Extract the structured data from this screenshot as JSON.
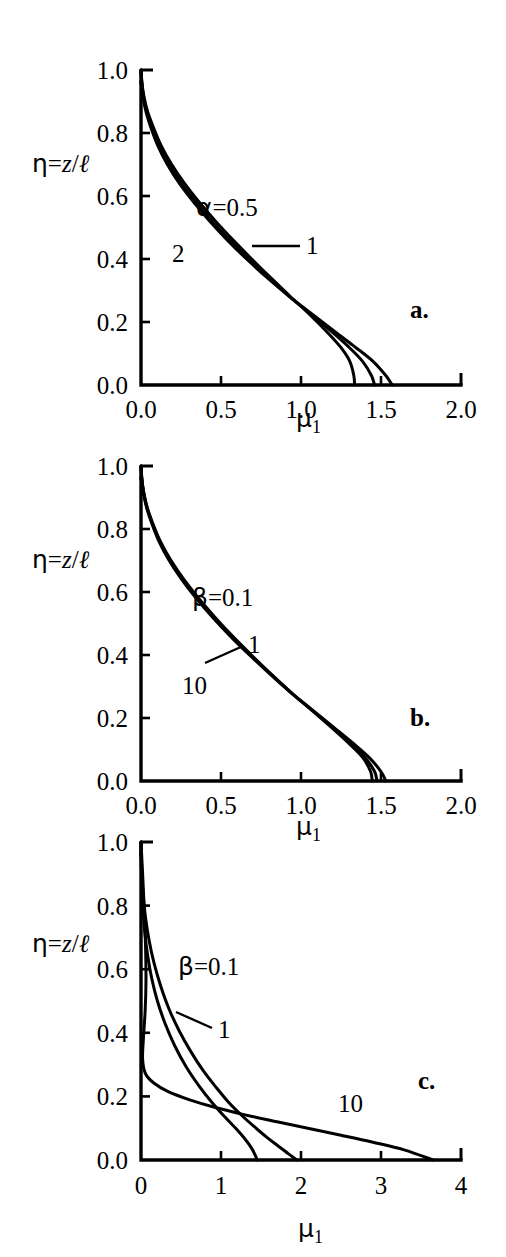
{
  "figure": {
    "background": "#ffffff",
    "line_color": "#000000",
    "axis_color": "#000000"
  },
  "panels": [
    {
      "id": "a",
      "letter": "a.",
      "y_axis_title": "η=z/ℓ",
      "x_axis_title": "μ₁",
      "x_ticks": [
        "0.0",
        "0.5",
        "1.0",
        "1.5",
        "2.0"
      ],
      "y_ticks": [
        "0.0",
        "0.2",
        "0.4",
        "0.6",
        "0.8",
        "1.0"
      ],
      "curve_labels": [
        {
          "text": "α=0.5",
          "name": "alpha-0p5"
        },
        {
          "text": "1",
          "name": "alpha-1"
        },
        {
          "text": "2",
          "name": "alpha-2"
        }
      ]
    },
    {
      "id": "b",
      "letter": "b.",
      "y_axis_title": "η=z/ℓ",
      "x_axis_title": "μ₁",
      "x_ticks": [
        "0.0",
        "0.5",
        "1.0",
        "1.5",
        "2.0"
      ],
      "y_ticks": [
        "0.0",
        "0.2",
        "0.4",
        "0.6",
        "0.8",
        "1.0"
      ],
      "curve_labels": [
        {
          "text": "β=0.1",
          "name": "beta-0p1"
        },
        {
          "text": "1",
          "name": "beta-1"
        },
        {
          "text": "10",
          "name": "beta-10"
        }
      ]
    },
    {
      "id": "c",
      "letter": "c.",
      "y_axis_title": "η=z/ℓ",
      "x_axis_title": "μ₁",
      "x_ticks": [
        "0",
        "1",
        "2",
        "3",
        "4"
      ],
      "y_ticks": [
        "0.0",
        "0.2",
        "0.4",
        "0.6",
        "0.8",
        "1.0"
      ],
      "curve_labels": [
        {
          "text": "β=0.1",
          "name": "beta-0p1"
        },
        {
          "text": "1",
          "name": "beta-1"
        },
        {
          "text": "10",
          "name": "beta-10"
        }
      ]
    }
  ],
  "chart_data": [
    {
      "type": "line",
      "panel": "a",
      "title": "",
      "xlabel": "μ₁",
      "ylabel": "η=z/ℓ",
      "xlim": [
        0.0,
        2.0
      ],
      "ylim": [
        0.0,
        1.0
      ],
      "xticks": [
        0.0,
        0.5,
        1.0,
        1.5,
        2.0
      ],
      "yticks": [
        0.0,
        0.2,
        0.4,
        0.6,
        0.8,
        1.0
      ],
      "grid": false,
      "legend": "inline-labels",
      "annotations": [
        "α=0.5",
        "1",
        "2",
        "a."
      ],
      "series": [
        {
          "name": "α=0.5",
          "x": [
            0.0,
            0.004,
            0.012,
            0.03,
            0.06,
            0.105,
            0.165,
            0.24,
            0.33,
            0.43,
            0.54,
            0.66,
            0.79,
            0.93,
            1.07,
            1.21,
            1.34,
            1.45,
            1.53,
            1.57
          ],
          "y": [
            1.0,
            0.96,
            0.92,
            0.87,
            0.82,
            0.76,
            0.7,
            0.64,
            0.58,
            0.52,
            0.46,
            0.4,
            0.34,
            0.28,
            0.225,
            0.17,
            0.12,
            0.075,
            0.03,
            0.0
          ]
        },
        {
          "name": "1",
          "x": [
            0.0,
            0.005,
            0.014,
            0.034,
            0.066,
            0.113,
            0.175,
            0.252,
            0.342,
            0.443,
            0.553,
            0.672,
            0.798,
            0.93,
            1.062,
            1.19,
            1.3,
            1.385,
            1.44,
            1.46
          ],
          "y": [
            1.0,
            0.96,
            0.92,
            0.87,
            0.82,
            0.76,
            0.7,
            0.64,
            0.58,
            0.52,
            0.46,
            0.4,
            0.34,
            0.28,
            0.225,
            0.17,
            0.12,
            0.075,
            0.03,
            0.0
          ]
        },
        {
          "name": "2",
          "x": [
            0.0,
            0.006,
            0.017,
            0.04,
            0.076,
            0.126,
            0.192,
            0.272,
            0.364,
            0.466,
            0.576,
            0.692,
            0.812,
            0.935,
            1.052,
            1.16,
            1.248,
            1.305,
            1.33,
            1.335
          ],
          "y": [
            1.0,
            0.96,
            0.92,
            0.87,
            0.82,
            0.76,
            0.7,
            0.64,
            0.58,
            0.52,
            0.46,
            0.4,
            0.34,
            0.28,
            0.225,
            0.17,
            0.12,
            0.075,
            0.03,
            0.0
          ]
        }
      ]
    },
    {
      "type": "line",
      "panel": "b",
      "title": "",
      "xlabel": "μ₁",
      "ylabel": "η=z/ℓ",
      "xlim": [
        0.0,
        2.0
      ],
      "ylim": [
        0.0,
        1.0
      ],
      "xticks": [
        0.0,
        0.5,
        1.0,
        1.5,
        2.0
      ],
      "yticks": [
        0.0,
        0.2,
        0.4,
        0.6,
        0.8,
        1.0
      ],
      "grid": false,
      "legend": "inline-labels",
      "annotations": [
        "β=0.1",
        "1",
        "10",
        "b."
      ],
      "series": [
        {
          "name": "β=0.1",
          "x": [
            0.0,
            0.005,
            0.014,
            0.034,
            0.066,
            0.113,
            0.176,
            0.254,
            0.345,
            0.447,
            0.558,
            0.678,
            0.805,
            0.938,
            1.072,
            1.205,
            1.325,
            1.425,
            1.5,
            1.53
          ],
          "y": [
            1.0,
            0.96,
            0.92,
            0.87,
            0.82,
            0.76,
            0.7,
            0.64,
            0.58,
            0.52,
            0.46,
            0.4,
            0.34,
            0.28,
            0.225,
            0.17,
            0.12,
            0.075,
            0.03,
            0.0
          ]
        },
        {
          "name": "1",
          "x": [
            0.0,
            0.005,
            0.015,
            0.036,
            0.069,
            0.118,
            0.182,
            0.261,
            0.353,
            0.455,
            0.566,
            0.685,
            0.81,
            0.94,
            1.07,
            1.198,
            1.31,
            1.4,
            1.46,
            1.475
          ],
          "y": [
            1.0,
            0.96,
            0.92,
            0.87,
            0.82,
            0.76,
            0.7,
            0.64,
            0.58,
            0.52,
            0.46,
            0.4,
            0.34,
            0.28,
            0.225,
            0.17,
            0.12,
            0.075,
            0.03,
            0.0
          ]
        },
        {
          "name": "10",
          "x": [
            0.0,
            0.005,
            0.016,
            0.038,
            0.072,
            0.122,
            0.188,
            0.268,
            0.36,
            0.462,
            0.572,
            0.69,
            0.812,
            0.94,
            1.066,
            1.19,
            1.298,
            1.385,
            1.435,
            1.445
          ],
          "y": [
            1.0,
            0.96,
            0.92,
            0.87,
            0.82,
            0.76,
            0.7,
            0.64,
            0.58,
            0.52,
            0.46,
            0.4,
            0.34,
            0.28,
            0.225,
            0.17,
            0.12,
            0.075,
            0.03,
            0.0
          ]
        }
      ]
    },
    {
      "type": "line",
      "panel": "c",
      "title": "",
      "xlabel": "μ₁",
      "ylabel": "η=z/ℓ",
      "xlim": [
        0,
        4
      ],
      "ylim": [
        0.0,
        1.0
      ],
      "xticks": [
        0,
        1,
        2,
        3,
        4
      ],
      "yticks": [
        0.0,
        0.2,
        0.4,
        0.6,
        0.8,
        1.0
      ],
      "grid": false,
      "legend": "inline-labels",
      "annotations": [
        "β=0.1",
        "1",
        "10",
        "c."
      ],
      "series": [
        {
          "name": "β=0.1",
          "x": [
            0.0,
            0.002,
            0.006,
            0.014,
            0.028,
            0.05,
            0.085,
            0.135,
            0.205,
            0.3,
            0.42,
            0.56,
            0.72,
            0.89,
            1.05,
            1.19,
            1.3,
            1.38,
            1.43,
            1.45
          ],
          "y": [
            1.0,
            0.95,
            0.9,
            0.84,
            0.78,
            0.71,
            0.64,
            0.57,
            0.5,
            0.43,
            0.36,
            0.295,
            0.235,
            0.18,
            0.135,
            0.098,
            0.066,
            0.038,
            0.014,
            0.0
          ]
        },
        {
          "name": "1",
          "x": [
            0.0,
            0.004,
            0.012,
            0.028,
            0.055,
            0.098,
            0.16,
            0.245,
            0.35,
            0.48,
            0.625,
            0.78,
            0.94,
            1.1,
            1.26,
            1.42,
            1.57,
            1.71,
            1.84,
            1.95
          ],
          "y": [
            1.0,
            0.945,
            0.89,
            0.83,
            0.765,
            0.695,
            0.622,
            0.548,
            0.475,
            0.405,
            0.34,
            0.28,
            0.228,
            0.18,
            0.14,
            0.104,
            0.072,
            0.045,
            0.02,
            0.0
          ]
        },
        {
          "name": "10",
          "x": [
            0.0,
            0.02,
            0.042,
            0.058,
            0.062,
            0.052,
            0.032,
            0.02,
            0.055,
            0.16,
            0.34,
            0.6,
            0.93,
            1.3,
            1.7,
            2.1,
            2.5,
            2.9,
            3.29,
            3.65
          ],
          "y": [
            1.0,
            0.9,
            0.78,
            0.66,
            0.56,
            0.47,
            0.39,
            0.318,
            0.272,
            0.242,
            0.215,
            0.19,
            0.165,
            0.142,
            0.12,
            0.099,
            0.078,
            0.056,
            0.032,
            0.0
          ]
        }
      ]
    }
  ]
}
